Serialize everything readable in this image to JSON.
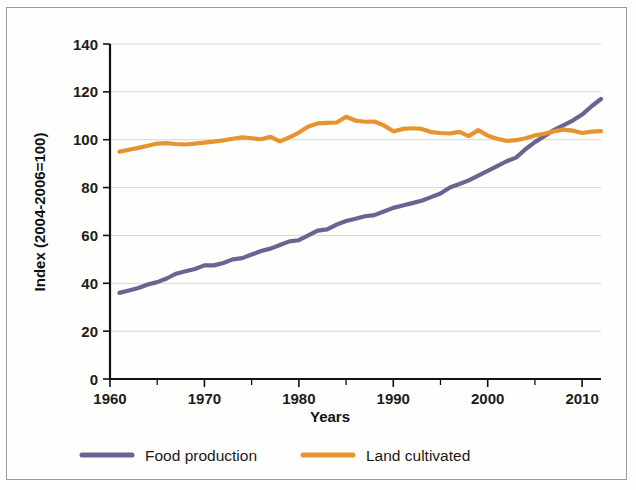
{
  "chart_data": {
    "type": "line",
    "title": "",
    "xlabel": "Years",
    "ylabel": "Index (2004-2006=100)",
    "xlim": [
      1960,
      2012
    ],
    "ylim": [
      0,
      140
    ],
    "xticks": [
      1960,
      1970,
      1980,
      1990,
      2000,
      2010
    ],
    "yticks": [
      0,
      20,
      40,
      60,
      80,
      100,
      120,
      140
    ],
    "grid": true,
    "legend_position": "bottom",
    "x": [
      1961,
      1962,
      1963,
      1964,
      1965,
      1966,
      1967,
      1968,
      1969,
      1970,
      1971,
      1972,
      1973,
      1974,
      1975,
      1976,
      1977,
      1978,
      1979,
      1980,
      1981,
      1982,
      1983,
      1984,
      1985,
      1986,
      1987,
      1988,
      1989,
      1990,
      1991,
      1992,
      1993,
      1994,
      1995,
      1996,
      1997,
      1998,
      1999,
      2000,
      2001,
      2002,
      2003,
      2004,
      2005,
      2006,
      2007,
      2008,
      2009,
      2010,
      2011,
      2012
    ],
    "series": [
      {
        "name": "Food production",
        "color": "#6d6393",
        "values": [
          36,
          37,
          38,
          39.5,
          40.5,
          42,
          44,
          45,
          46,
          47.5,
          47.5,
          48.5,
          50,
          50.5,
          52,
          53.5,
          54.5,
          56,
          57.5,
          58,
          60,
          62,
          62.5,
          64.5,
          66,
          67,
          68,
          68.5,
          70,
          71.5,
          72.5,
          73.5,
          74.5,
          76,
          77.5,
          80,
          81.5,
          83,
          85,
          87,
          89,
          91,
          92.5,
          96,
          99,
          101.5,
          104,
          106,
          108,
          110.5,
          114,
          117
        ]
      },
      {
        "name": "Land cultivated",
        "color": "#e8942e",
        "values": [
          95,
          95.8,
          96.6,
          97.5,
          98.4,
          98.6,
          98.2,
          98,
          98.4,
          98.8,
          99.2,
          99.7,
          100.4,
          101,
          100.6,
          100.2,
          101.2,
          99.3,
          101,
          103,
          105.5,
          106.8,
          107,
          107.2,
          109.6,
          108,
          107.5,
          107.6,
          106,
          103.5,
          104.5,
          104.8,
          104.5,
          103.2,
          102.8,
          102.6,
          103.3,
          101.5,
          104,
          101.7,
          100.4,
          99.5,
          99.8,
          100.6,
          101.8,
          102.5,
          103.5,
          104.2,
          103.8,
          102.8,
          103.4,
          103.6
        ]
      }
    ]
  },
  "legend": {
    "items": [
      {
        "label": "Food production",
        "color": "#6d6393"
      },
      {
        "label": "Land cultivated",
        "color": "#e8942e"
      }
    ]
  },
  "axes": {
    "y_title": "Index (2004-2006=100)",
    "x_title": "Years",
    "y_tick_labels": [
      "140",
      "120",
      "100",
      "80",
      "60",
      "40",
      "20",
      "0"
    ],
    "x_tick_labels": [
      "1960",
      "1970",
      "1980",
      "1990",
      "2000",
      "2010"
    ]
  }
}
